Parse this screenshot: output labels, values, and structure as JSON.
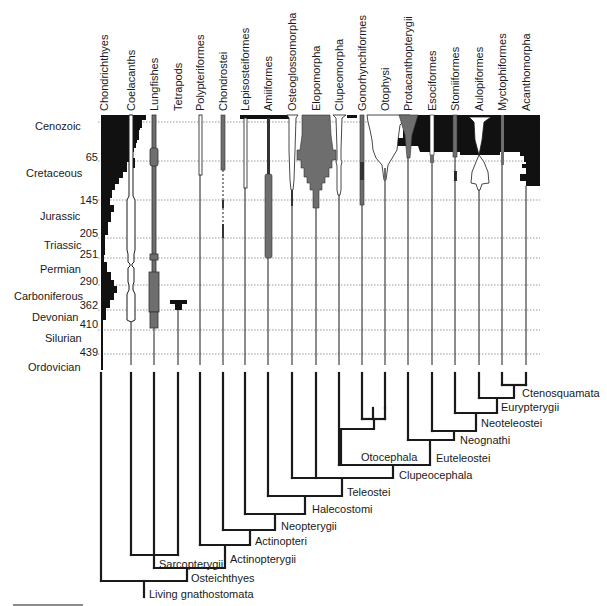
{
  "diagram": {
    "type": "time-calibrated phylogeny",
    "taxa": [
      {
        "name": "Chondrichthyes",
        "x": 104
      },
      {
        "name": "Coelacanths",
        "x": 131
      },
      {
        "name": "Lungfishes",
        "x": 154
      },
      {
        "name": "Tetrapods",
        "x": 178
      },
      {
        "name": "Polypteriformes",
        "x": 200
      },
      {
        "name": "Chondrostei",
        "x": 223
      },
      {
        "name": "Lepisosteiformes",
        "x": 245
      },
      {
        "name": "Amiiformes",
        "x": 268
      },
      {
        "name": "Osteoglossomorpha",
        "x": 292
      },
      {
        "name": "Elopomorpha",
        "x": 316
      },
      {
        "name": "Clupeomorpha",
        "x": 339
      },
      {
        "name": "Gonorhynchiformes",
        "x": 362
      },
      {
        "name": "Otophysi",
        "x": 385
      },
      {
        "name": "Protacanthopterygii",
        "x": 408
      },
      {
        "name": "Esociformes",
        "x": 432
      },
      {
        "name": "Stomiiformes",
        "x": 455
      },
      {
        "name": "Aulopiformes",
        "x": 479
      },
      {
        "name": "Myctophiformes",
        "x": 502
      },
      {
        "name": "Acanthomorpha",
        "x": 526
      }
    ],
    "periods": [
      {
        "name": "Cenozoic",
        "y": 126
      },
      {
        "name": "Cretaceous",
        "y": 175
      },
      {
        "name": "Jurassic",
        "y": 216
      },
      {
        "name": "Triassic",
        "y": 244
      },
      {
        "name": "Permian",
        "y": 268
      },
      {
        "name": "Carboniferous",
        "y": 295
      },
      {
        "name": "Devonian",
        "y": 320
      },
      {
        "name": "Silurian",
        "y": 337
      },
      {
        "name": "Ordovician",
        "y": 366
      }
    ],
    "ages_ma": [
      {
        "value": "65",
        "y": 156
      },
      {
        "value": "145",
        "y": 200
      },
      {
        "value": "205",
        "y": 233
      },
      {
        "value": "251",
        "y": 254
      },
      {
        "value": "290",
        "y": 280
      },
      {
        "value": "362",
        "y": 304
      },
      {
        "value": "410",
        "y": 324
      },
      {
        "value": "439",
        "y": 352
      }
    ],
    "clades": [
      {
        "name": "Ctenosquamata",
        "x": 544,
        "y": 394
      },
      {
        "name": "Eurypterygii",
        "x": 503,
        "y": 409
      },
      {
        "name": "Neoteleostei",
        "x": 484,
        "y": 423
      },
      {
        "name": "Neognathi",
        "x": 460,
        "y": 441
      },
      {
        "name": "Euteleostei",
        "x": 438,
        "y": 458
      },
      {
        "name": "Otocephala",
        "x": 363,
        "y": 453
      },
      {
        "name": "Clupeocephala",
        "x": 400,
        "y": 475
      },
      {
        "name": "Teleostei",
        "x": 348,
        "y": 489
      },
      {
        "name": "Halecostomi",
        "x": 312,
        "y": 507
      },
      {
        "name": "Neopterygii",
        "x": 281,
        "y": 524
      },
      {
        "name": "Actinopteri",
        "x": 257,
        "y": 541
      },
      {
        "name": "Actinopterygii",
        "x": 232,
        "y": 559
      },
      {
        "name": "Sarcopterygii",
        "x": 160,
        "y": 561
      },
      {
        "name": "Osteichthyes",
        "x": 192,
        "y": 577
      },
      {
        "name": "Living gnathostomata",
        "x": 149,
        "y": 593
      }
    ],
    "colors": {
      "black_fill": "#111111",
      "gray_fill": "#6e6e6e",
      "line": "#1a1a1a",
      "grid": "#999999"
    }
  }
}
